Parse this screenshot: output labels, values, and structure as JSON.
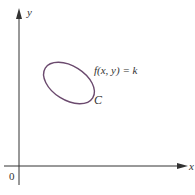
{
  "diagram": {
    "axes": {
      "x_label": "x",
      "y_label": "y",
      "origin_label": "0",
      "color": "#333333"
    },
    "curve": {
      "name": "C",
      "equation": "f(x, y) = k",
      "shape": "closed tilted ellipse",
      "color": "#6b4a6e"
    }
  }
}
